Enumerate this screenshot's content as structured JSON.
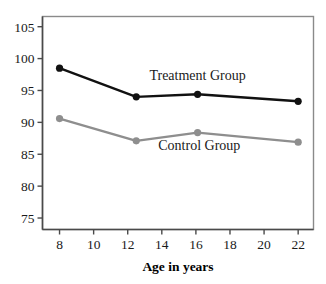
{
  "chart_data": {
    "type": "line",
    "title": "",
    "xlabel": "Age in years",
    "ylabel": "",
    "xlim": [
      7.0,
      22.9
    ],
    "ylim": [
      73.2,
      106.6
    ],
    "grid": false,
    "legend_position": "inline-annotations",
    "xticks": [
      8,
      10,
      12,
      14,
      16,
      18,
      20,
      22
    ],
    "xtick_labels": [
      "8",
      "10",
      "12",
      "14",
      "16",
      "18",
      "20",
      "22"
    ],
    "yticks": [
      75,
      80,
      85,
      90,
      95,
      100,
      105
    ],
    "ytick_labels": [
      "75",
      "80",
      "85",
      "90",
      "95",
      "100",
      "105"
    ],
    "x": [
      8.0,
      12.5,
      16.1,
      22.0
    ],
    "series": [
      {
        "name": "Treatment Group",
        "color": "#111111",
        "marker": "circle",
        "values": [
          98.5,
          94.0,
          94.4,
          93.3
        ],
        "annotation": "Treatment Group",
        "annotation_x": 16.1,
        "annotation_y": 96.6
      },
      {
        "name": "Control Group",
        "color": "#8e8e8e",
        "marker": "circle",
        "values": [
          90.6,
          87.1,
          88.4,
          86.9
        ],
        "annotation": "Control Group",
        "annotation_x": 16.2,
        "annotation_y": 85.6
      }
    ],
    "frame_color": "#8a8a8a",
    "axis_color": "#4a4a4a",
    "background": "#ffffff"
  }
}
